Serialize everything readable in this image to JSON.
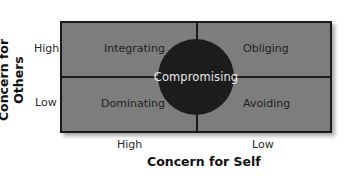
{
  "diagram": {
    "type": "2x2 conflict-handling styles matrix",
    "quadrants": {
      "top_left": "Integrating",
      "top_right": "Obliging",
      "bottom_left": "Dominating",
      "bottom_right": "Avoiding"
    },
    "center": "Compromising",
    "y_axis": {
      "title": "Concern for Others",
      "ticks": [
        "High",
        "Low"
      ]
    },
    "x_axis": {
      "title": "Concern for Self",
      "ticks": [
        "High",
        "Low"
      ]
    },
    "colors": {
      "quadrant_fill": "#7d7d7d",
      "circle_fill": "#1c1c1c",
      "border": "#1a1a1a",
      "circle_text": "#e8e8e8"
    }
  }
}
